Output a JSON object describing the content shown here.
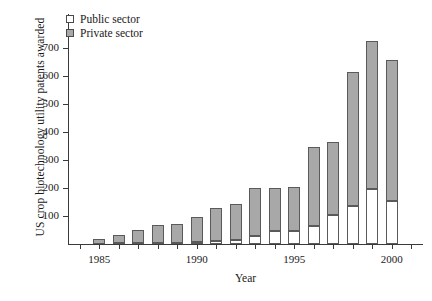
{
  "chart_data": {
    "type": "bar",
    "stacked": true,
    "title": "",
    "xlabel": "Year",
    "ylabel": "US crop biotechnology utility patents awarded",
    "categories": [
      1984,
      1985,
      1986,
      1987,
      1988,
      1989,
      1990,
      1991,
      1992,
      1993,
      1994,
      1995,
      1996,
      1997,
      1998,
      1999,
      2000,
      2001
    ],
    "xtick_labels": [
      "1985",
      "1990",
      "1995",
      "2000"
    ],
    "xtick_values": [
      1985,
      1990,
      1995,
      2000
    ],
    "ytick_labels": [
      "100",
      "200",
      "300",
      "400",
      "500",
      "600",
      "700"
    ],
    "ytick_values": [
      100,
      200,
      300,
      400,
      500,
      600,
      700
    ],
    "ylim": [
      0,
      820
    ],
    "xlim": [
      1983.4,
      2001.6
    ],
    "grid": false,
    "legend_position": "top-left",
    "series": [
      {
        "name": "Public sector",
        "color": "#ffffff",
        "values": [
          0,
          0,
          2,
          3,
          4,
          5,
          6,
          12,
          16,
          30,
          48,
          48,
          65,
          105,
          137,
          196,
          155,
          0
        ]
      },
      {
        "name": "Private sector",
        "color": "#a8a8a8",
        "values": [
          0,
          18,
          31,
          47,
          63,
          68,
          91,
          117,
          126,
          169,
          152,
          157,
          281,
          258,
          478,
          528,
          500,
          0
        ]
      }
    ],
    "totals": [
      0,
      18,
      33,
      50,
      67,
      73,
      97,
      129,
      142,
      199,
      200,
      205,
      346,
      363,
      615,
      724,
      655,
      0
    ]
  },
  "legend": {
    "items": [
      {
        "label": "Public sector",
        "swatch": "public"
      },
      {
        "label": "Private sector",
        "swatch": "private"
      }
    ]
  }
}
